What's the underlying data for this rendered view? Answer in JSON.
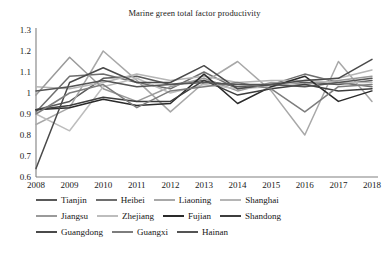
{
  "chart_data": {
    "type": "line",
    "title": "Marine green total factor productivity",
    "xlabel": "",
    "ylabel": "",
    "x": [
      2008,
      2009,
      2010,
      2011,
      2012,
      2013,
      2014,
      2015,
      2016,
      2017,
      2018
    ],
    "xtick_labels": [
      "2008",
      "2009",
      "2010",
      "2011",
      "2012",
      "2013",
      "2014",
      "2015",
      "2016",
      "2017",
      "2018"
    ],
    "ytick_labels": [
      "0.6",
      "0.7",
      "0.8",
      "0.9",
      "1",
      "1.1",
      "1.2",
      "1.3"
    ],
    "ytick_values": [
      0.6,
      0.7,
      0.8,
      0.9,
      1.0,
      1.1,
      1.2,
      1.3
    ],
    "ylim": [
      0.6,
      1.3
    ],
    "xlim": [
      2008,
      2018
    ],
    "grid": false,
    "legend_position": "bottom",
    "series": [
      {
        "name": "Tianjin",
        "color": "#595959",
        "values": [
          0.92,
          0.96,
          1.07,
          1.08,
          1.04,
          1.06,
          1.03,
          1.04,
          1.05,
          1.04,
          1.06
        ]
      },
      {
        "name": "Heibei",
        "color": "#6e6e6e",
        "values": [
          0.91,
          1.08,
          1.09,
          1.05,
          1.02,
          1.1,
          1.02,
          1.04,
          1.09,
          1.05,
          1.03
        ]
      },
      {
        "name": "Liaoning",
        "color": "#a8a8a8",
        "values": [
          0.85,
          0.93,
          1.2,
          1.06,
          0.91,
          1.05,
          1.15,
          1.01,
          0.8,
          1.15,
          0.96
        ]
      },
      {
        "name": "Shanghai",
        "color": "#b5b5b5",
        "values": [
          1.03,
          1.02,
          1.05,
          1.09,
          1.06,
          1.08,
          1.05,
          1.06,
          1.06,
          1.07,
          1.11
        ]
      },
      {
        "name": "Jiangsu",
        "color": "#9a9a9a",
        "values": [
          0.99,
          1.17,
          1.02,
          0.96,
          1.03,
          1.07,
          1.01,
          1.05,
          1.04,
          1.06,
          1.08
        ]
      },
      {
        "name": "Zhejiang",
        "color": "#bdbdbd",
        "values": [
          0.9,
          0.82,
          1.03,
          1.07,
          1.0,
          1.04,
          1.02,
          1.03,
          1.06,
          1.05,
          1.05
        ]
      },
      {
        "name": "Fujian",
        "color": "#2a2a2a",
        "values": [
          0.92,
          0.93,
          0.97,
          0.94,
          0.95,
          1.09,
          0.95,
          1.03,
          1.08,
          0.96,
          1.01
        ]
      },
      {
        "name": "Shandong",
        "color": "#3d3d3d",
        "values": [
          0.92,
          0.94,
          0.98,
          0.96,
          0.96,
          1.06,
          0.99,
          1.02,
          1.04,
          1.01,
          1.02
        ]
      },
      {
        "name": "Guangdong",
        "color": "#4a4a4a",
        "values": [
          0.64,
          1.05,
          1.12,
          1.05,
          1.05,
          1.13,
          1.02,
          1.04,
          1.06,
          1.07,
          1.16
        ]
      },
      {
        "name": "Guangxi",
        "color": "#7d7d7d",
        "values": [
          0.9,
          1.0,
          1.04,
          0.93,
          1.01,
          1.03,
          1.05,
          1.02,
          0.91,
          1.03,
          1.04
        ]
      },
      {
        "name": "Hainan",
        "color": "#545454",
        "values": [
          1.01,
          1.03,
          1.06,
          1.03,
          1.04,
          1.05,
          1.04,
          1.04,
          1.03,
          1.05,
          1.07
        ]
      }
    ]
  },
  "legend": {
    "rows": [
      [
        "Tianjin",
        "Heibei",
        "Liaoning",
        "Shanghai"
      ],
      [
        "Jiangsu",
        "Zhejiang",
        "Fujian",
        "Shandong"
      ],
      [
        "Guangdong",
        "Guangxi",
        "Hainan"
      ]
    ]
  },
  "axis": {
    "line_color": "#808080"
  }
}
